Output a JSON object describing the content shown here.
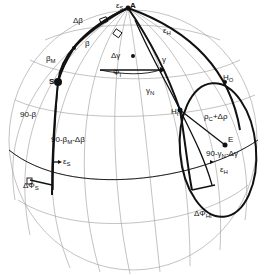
{
  "diagram": {
    "type": "spherical-geometry",
    "points": {
      "A": "A",
      "S": "S",
      "E": "E",
      "H1": "H",
      "H1_sub": "I",
      "H0": "H",
      "H0_sub": "O"
    },
    "labels": {
      "epsilon_s_top": "ε",
      "epsilon_s_top_sub": "S",
      "epsilon_h_top": "ε",
      "epsilon_h_top_sub": "H",
      "delta_beta": "Δβ",
      "beta": "β",
      "beta_m": "β",
      "beta_m_sub": "M",
      "delta_gamma": "Δγ",
      "phi_i": "Φ",
      "phi_i_sub": "I",
      "gamma": "γ",
      "gamma_n": "γ",
      "gamma_n_sub": "N",
      "rho": "ρ",
      "rho_sub": "C",
      "rho_rest": "+Δρ",
      "ninety_beta": "90-β",
      "ninety_beta_m": "90-β",
      "ninety_beta_m_sub": "M",
      "ninety_beta_m_rest": "-Δβ",
      "epsilon_s_low": "ε",
      "epsilon_s_low_sub": "S",
      "delta_phi_s": "ΔΦ",
      "delta_phi_s_sub": "S",
      "ninety_gamma": "90-γ",
      "ninety_gamma_sub": "N",
      "ninety_gamma_rest": "-Δγ",
      "epsilon_h_low": "ε",
      "epsilon_h_low_sub": "H",
      "delta_phi_hi": "ΔΦ",
      "delta_phi_hi_sub": "HI"
    },
    "colors": {
      "ink": "#111111",
      "grid": "#9a9a9a",
      "background": "#ffffff"
    }
  }
}
